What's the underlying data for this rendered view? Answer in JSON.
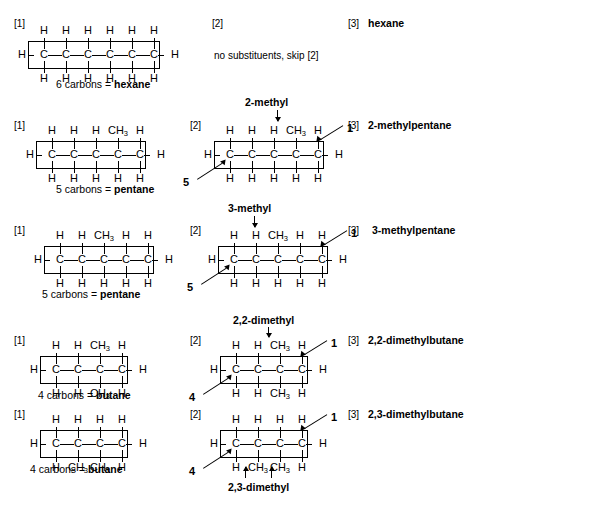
{
  "page": {
    "background": "#ffffff",
    "ink": "#000000"
  },
  "labels": {
    "step1": "[1]",
    "step2": "[2]",
    "step3": "[3]",
    "skip_note": "no substituents, skip [2]"
  },
  "rows": [
    {
      "id": "hexane",
      "step1_caption_prefix": "6 carbons = ",
      "step1_caption_name": "hexane",
      "step2_note": "no substituents, skip [2]",
      "step2_substituent": "",
      "step3_name": "hexane",
      "carbons": 6,
      "top": [
        "H",
        "H",
        "H",
        "H",
        "H",
        "H"
      ],
      "bottom": [
        "H",
        "H",
        "H",
        "H",
        "H",
        "H"
      ],
      "left_terminal": "H",
      "right_terminal": "H",
      "numbering_right": "",
      "numbering_left": ""
    },
    {
      "id": "2-methylpentane",
      "step1_caption_prefix": "5 carbons = ",
      "step1_caption_name": "pentane",
      "step2_substituent": "2-methyl",
      "step3_name": "2-methylpentane",
      "carbons": 5,
      "top": [
        "H",
        "H",
        "H",
        "CH3",
        "H"
      ],
      "bottom": [
        "H",
        "H",
        "H",
        "H",
        "H"
      ],
      "left_terminal": "H",
      "right_terminal": "H",
      "numbering_right": "1",
      "numbering_left": "5"
    },
    {
      "id": "3-methylpentane",
      "step1_caption_prefix": "5 carbons = ",
      "step1_caption_name": "pentane",
      "step2_substituent": "3-methyl",
      "step3_name": "3-methylpentane",
      "carbons": 5,
      "top": [
        "H",
        "H",
        "CH3",
        "H",
        "H"
      ],
      "bottom": [
        "H",
        "H",
        "H",
        "H",
        "H"
      ],
      "left_terminal": "H",
      "right_terminal": "H",
      "numbering_right": "1",
      "numbering_left": "5"
    },
    {
      "id": "2,2-dimethylbutane",
      "step1_caption_prefix": "4 carbons = ",
      "step1_caption_name": "butane",
      "step2_substituent": "2,2-dimethyl",
      "step3_name": "2,2-dimethylbutane",
      "carbons": 4,
      "top": [
        "H",
        "H",
        "CH3",
        "H"
      ],
      "bottom": [
        "H",
        "H",
        "CH3",
        "H"
      ],
      "left_terminal": "H",
      "right_terminal": "H",
      "numbering_right": "1",
      "numbering_left": "4"
    },
    {
      "id": "2,3-dimethylbutane",
      "step1_caption_prefix": "4 carbons = ",
      "step1_caption_name": "butane",
      "step2_substituent": "2,3-dimethyl",
      "step3_name": "2,3-dimethylbutane",
      "carbons": 4,
      "top": [
        "H",
        "H",
        "H",
        "H"
      ],
      "bottom": [
        "H",
        "CH3",
        "CH3",
        "H"
      ],
      "left_terminal": "H",
      "right_terminal": "H",
      "numbering_right": "1",
      "numbering_left": "4"
    }
  ]
}
